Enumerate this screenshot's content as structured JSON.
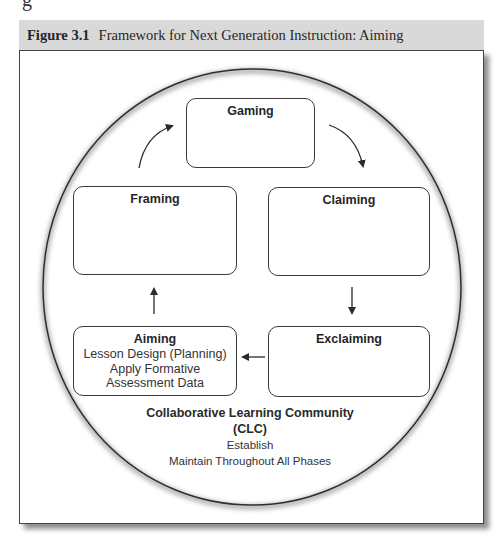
{
  "page_fragment": "g",
  "figure": {
    "number": "Figure 3.1",
    "title": "Framework for Next Generation Instruction: Aiming"
  },
  "diagram": {
    "boxes": {
      "gaming": {
        "title": "Gaming",
        "lines": []
      },
      "framing": {
        "title": "Framing",
        "lines": []
      },
      "claiming": {
        "title": "Claiming",
        "lines": []
      },
      "aiming": {
        "title": "Aiming",
        "lines": [
          "Lesson Design (Planning)",
          "Apply Formative",
          "Assessment Data"
        ]
      },
      "exclaiming": {
        "title": "Exclaiming",
        "lines": []
      }
    },
    "cycle_order": [
      "Aiming",
      "Framing",
      "Gaming",
      "Claiming",
      "Exclaiming",
      "Aiming"
    ],
    "clc": {
      "title": "Collaborative Learning Community",
      "abbr": "(CLC)",
      "lines": [
        "Establish",
        "Maintain Throughout All Phases"
      ]
    }
  },
  "colors": {
    "header_band": "#d9d9d9",
    "stroke": "#3a3a3a",
    "background": "#ffffff"
  }
}
